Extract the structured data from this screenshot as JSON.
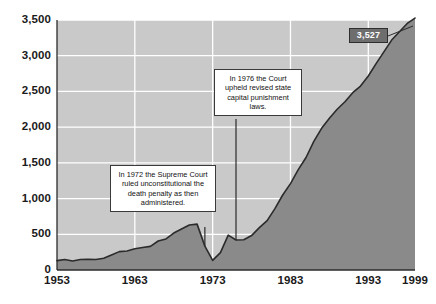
{
  "chart_data": {
    "type": "area",
    "title": "",
    "xlabel": "",
    "ylabel": "",
    "xlim": [
      1953,
      1999
    ],
    "ylim": [
      0,
      3500
    ],
    "grid": true,
    "legend": "none",
    "xticks": [
      "1953",
      "1963",
      "1973",
      "1983",
      "1993",
      "1999"
    ],
    "xtick_values": [
      1953,
      1963,
      1973,
      1983,
      1993,
      1999
    ],
    "yticks": [
      "0",
      "500",
      "1,000",
      "1,500",
      "2,000",
      "2,500",
      "3,000",
      "3,500"
    ],
    "ytick_values": [
      0,
      500,
      1000,
      1500,
      2000,
      2500,
      3000,
      3500
    ],
    "series": [
      {
        "name": "Prisoners under sentence of death",
        "x": [
          1953,
          1954,
          1955,
          1956,
          1957,
          1958,
          1959,
          1960,
          1961,
          1962,
          1963,
          1964,
          1965,
          1966,
          1967,
          1968,
          1969,
          1970,
          1971,
          1972,
          1973,
          1974,
          1975,
          1976,
          1977,
          1978,
          1979,
          1980,
          1981,
          1982,
          1983,
          1984,
          1985,
          1986,
          1987,
          1988,
          1989,
          1990,
          1991,
          1992,
          1993,
          1994,
          1995,
          1996,
          1997,
          1998,
          1999
        ],
        "values": [
          131,
          147,
          125,
          146,
          151,
          147,
          164,
          210,
          257,
          267,
          297,
          315,
          331,
          406,
          435,
          517,
          575,
          631,
          642,
          334,
          134,
          244,
          488,
          420,
          423,
          482,
          593,
          691,
          860,
          1050,
          1209,
          1405,
          1575,
          1800,
          1984,
          2124,
          2250,
          2356,
          2482,
          2575,
          2716,
          2890,
          3054,
          3219,
          3335,
          3452,
          3527
        ]
      }
    ],
    "data_labels": [
      {
        "value": "3,527",
        "x": 1999,
        "y": 3527
      }
    ],
    "annotations": [
      {
        "id": "annotation-1972",
        "text": "In 1972 the Supreme Court ruled unconstitutional the death penalty as then administered.",
        "points_to_x": 1972
      },
      {
        "id": "annotation-1976",
        "text": "In 1976 the Court upheld revised state capital punishment laws.",
        "points_to_x": 1976
      }
    ],
    "colors": {
      "plot_background": "#c9c9c9",
      "gridline": "#ffffff",
      "area_fill": "#8a8a8a",
      "series_line": "#2b2b2b",
      "axis": "#2b2b2b",
      "label_box_fill": "#6e6e6e",
      "label_box_text": "#ffffff",
      "annotation_box_fill": "#ffffff",
      "annotation_box_border": "#3a3a3a",
      "tick_text": "#1a1a1a",
      "page_background": "#ffffff"
    }
  }
}
